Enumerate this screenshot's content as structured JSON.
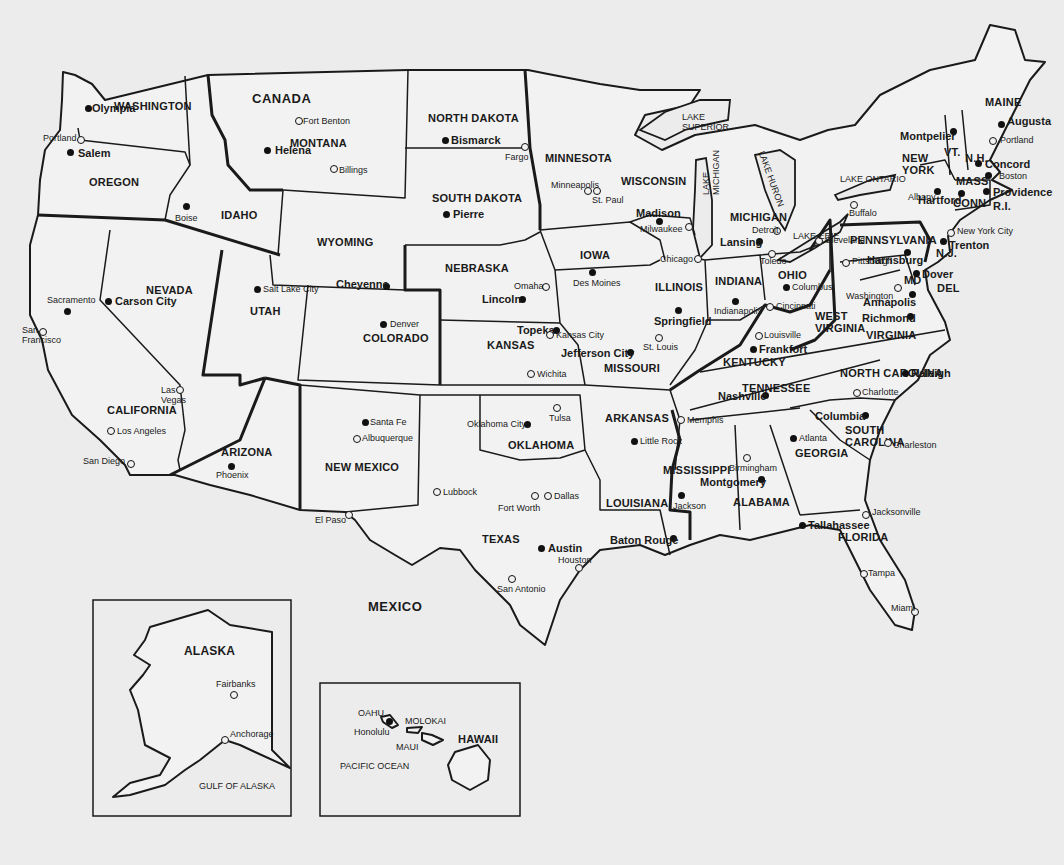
{
  "map": {
    "title": "United States Political Map",
    "countries": [
      {
        "name": "CANADA",
        "x": 252,
        "y": 92
      },
      {
        "name": "MEXICO",
        "x": 368,
        "y": 600
      }
    ],
    "states": [
      {
        "name": "WASHINGTON",
        "x": 114,
        "y": 101
      },
      {
        "name": "OREGON",
        "x": 89,
        "y": 177
      },
      {
        "name": "IDAHO",
        "x": 221,
        "y": 210
      },
      {
        "name": "MONTANA",
        "x": 290,
        "y": 138
      },
      {
        "name": "WYOMING",
        "x": 317,
        "y": 237
      },
      {
        "name": "NEVADA",
        "x": 146,
        "y": 285
      },
      {
        "name": "UTAH",
        "x": 250,
        "y": 306
      },
      {
        "name": "COLORADO",
        "x": 363,
        "y": 333
      },
      {
        "name": "CALIFORNIA",
        "x": 107,
        "y": 405
      },
      {
        "name": "ARIZONA",
        "x": 221,
        "y": 447
      },
      {
        "name": "NEW MEXICO",
        "x": 325,
        "y": 462
      },
      {
        "name": "NORTH DAKOTA",
        "x": 428,
        "y": 113
      },
      {
        "name": "SOUTH DAKOTA",
        "x": 432,
        "y": 193
      },
      {
        "name": "NEBRASKA",
        "x": 445,
        "y": 263
      },
      {
        "name": "KANSAS",
        "x": 487,
        "y": 340
      },
      {
        "name": "OKLAHOMA",
        "x": 508,
        "y": 440
      },
      {
        "name": "TEXAS",
        "x": 482,
        "y": 534
      },
      {
        "name": "MINNESOTA",
        "x": 545,
        "y": 153
      },
      {
        "name": "IOWA",
        "x": 580,
        "y": 250
      },
      {
        "name": "MISSOURI",
        "x": 604,
        "y": 363
      },
      {
        "name": "ARKANSAS",
        "x": 605,
        "y": 413
      },
      {
        "name": "LOUISIANA",
        "x": 606,
        "y": 498
      },
      {
        "name": "WISCONSIN",
        "x": 621,
        "y": 176
      },
      {
        "name": "ILLINOIS",
        "x": 655,
        "y": 282
      },
      {
        "name": "MICHIGAN",
        "x": 730,
        "y": 212
      },
      {
        "name": "INDIANA",
        "x": 715,
        "y": 276
      },
      {
        "name": "OHIO",
        "x": 778,
        "y": 270
      },
      {
        "name": "KENTUCKY",
        "x": 723,
        "y": 357
      },
      {
        "name": "TENNESSEE",
        "x": 742,
        "y": 383
      },
      {
        "name": "MISSISSIPPI",
        "x": 663,
        "y": 465
      },
      {
        "name": "ALABAMA",
        "x": 733,
        "y": 497
      },
      {
        "name": "GEORGIA",
        "x": 795,
        "y": 448
      },
      {
        "name": "FLORIDA",
        "x": 838,
        "y": 532
      },
      {
        "name": "SOUTH CAROLINA",
        "x": 845,
        "y": 424,
        "multiline": [
          "SOUTH",
          "CAROLINA"
        ]
      },
      {
        "name": "NORTH CAROLINA",
        "x": 840,
        "y": 368
      },
      {
        "name": "VIRGINIA",
        "x": 866,
        "y": 330
      },
      {
        "name": "WEST VIRGINIA",
        "x": 815,
        "y": 310,
        "multiline": [
          "WEST",
          "VIRGINIA"
        ]
      },
      {
        "name": "PENNSYLVANIA",
        "x": 850,
        "y": 235
      },
      {
        "name": "NEW YORK",
        "x": 902,
        "y": 152,
        "multiline": [
          "NEW",
          "YORK"
        ]
      },
      {
        "name": "VT.",
        "x": 944,
        "y": 147
      },
      {
        "name": "N.H.",
        "x": 965,
        "y": 153
      },
      {
        "name": "MAINE",
        "x": 985,
        "y": 97
      },
      {
        "name": "MASS",
        "x": 956,
        "y": 176
      },
      {
        "name": "CONN",
        "x": 953,
        "y": 198
      },
      {
        "name": "R.I.",
        "x": 993,
        "y": 201
      },
      {
        "name": "N.J.",
        "x": 936,
        "y": 248
      },
      {
        "name": "MD",
        "x": 904,
        "y": 275
      },
      {
        "name": "DEL",
        "x": 937,
        "y": 283
      }
    ],
    "capitals": [
      {
        "name": "Olympia",
        "x": 88,
        "y": 108,
        "lx": 92,
        "ly": 103
      },
      {
        "name": "Salem",
        "x": 70,
        "y": 152,
        "lx": 78,
        "ly": 148
      },
      {
        "name": "Boise",
        "x": 186,
        "y": 206,
        "lx": 175,
        "ly": 214,
        "small": true
      },
      {
        "name": "Helena",
        "x": 267,
        "y": 150,
        "lx": 275,
        "ly": 145
      },
      {
        "name": "Bismarck",
        "x": 445,
        "y": 140,
        "lx": 451,
        "ly": 135
      },
      {
        "name": "Pierre",
        "x": 446,
        "y": 214,
        "lx": 453,
        "ly": 209
      },
      {
        "name": "Cheyenne",
        "x": 386,
        "y": 286,
        "lx": 336,
        "ly": 279
      },
      {
        "name": "Carson City",
        "x": 108,
        "y": 301,
        "lx": 115,
        "ly": 296
      },
      {
        "name": "Salt Lake City",
        "x": 257,
        "y": 289,
        "lx": 263,
        "ly": 285,
        "small": true
      },
      {
        "name": "Denver",
        "x": 383,
        "y": 324,
        "lx": 390,
        "ly": 320,
        "small": true
      },
      {
        "name": "Sacramento",
        "x": 67,
        "y": 311,
        "lx": 47,
        "ly": 296,
        "small": true
      },
      {
        "name": "Phoenix",
        "x": 231,
        "y": 466,
        "lx": 216,
        "ly": 471,
        "small": true
      },
      {
        "name": "Santa Fe",
        "x": 365,
        "y": 422,
        "lx": 370,
        "ly": 418,
        "small": true
      },
      {
        "name": "Lincoln",
        "x": 522,
        "y": 299,
        "lx": 482,
        "ly": 294
      },
      {
        "name": "Topeka",
        "x": 556,
        "y": 330,
        "lx": 517,
        "ly": 325
      },
      {
        "name": "Oklahoma City",
        "x": 527,
        "y": 424,
        "lx": 467,
        "ly": 420,
        "small": true
      },
      {
        "name": "Austin",
        "x": 541,
        "y": 548,
        "lx": 548,
        "ly": 543
      },
      {
        "name": "Des Moines",
        "x": 592,
        "y": 272,
        "lx": 573,
        "ly": 279,
        "small": true
      },
      {
        "name": "Jefferson City",
        "x": 630,
        "y": 352,
        "lx": 561,
        "ly": 348
      },
      {
        "name": "Little Rock",
        "x": 634,
        "y": 441,
        "lx": 640,
        "ly": 437,
        "small": true
      },
      {
        "name": "Baton Rouge",
        "x": 673,
        "y": 538,
        "lx": 610,
        "ly": 535
      },
      {
        "name": "Jackson",
        "x": 681,
        "y": 495,
        "lx": 673,
        "ly": 502,
        "small": true
      },
      {
        "name": "Madison",
        "x": 659,
        "y": 221,
        "lx": 636,
        "ly": 208
      },
      {
        "name": "Springfield",
        "x": 678,
        "y": 310,
        "lx": 654,
        "ly": 316
      },
      {
        "name": "Lansing",
        "x": 759,
        "y": 241,
        "lx": 720,
        "ly": 237
      },
      {
        "name": "Indianapolis",
        "x": 735,
        "y": 301,
        "lx": 714,
        "ly": 307,
        "small": true
      },
      {
        "name": "Columbus",
        "x": 786,
        "y": 287,
        "lx": 792,
        "ly": 283,
        "small": true
      },
      {
        "name": "Frankfort",
        "x": 753,
        "y": 349,
        "lx": 759,
        "ly": 344
      },
      {
        "name": "Nashville",
        "x": 765,
        "y": 395,
        "lx": 718,
        "ly": 391
      },
      {
        "name": "Montgomery",
        "x": 761,
        "y": 479,
        "lx": 700,
        "ly": 477
      },
      {
        "name": "Atlanta",
        "x": 793,
        "y": 438,
        "lx": 799,
        "ly": 434,
        "small": true
      },
      {
        "name": "Tallahassee",
        "x": 802,
        "y": 525,
        "lx": 808,
        "ly": 520
      },
      {
        "name": "Columbia",
        "x": 865,
        "y": 415,
        "lx": 815,
        "ly": 411
      },
      {
        "name": "Raleigh",
        "x": 905,
        "y": 373,
        "lx": 911,
        "ly": 368
      },
      {
        "name": "Richmond",
        "x": 910,
        "y": 316,
        "lx": 862,
        "ly": 313
      },
      {
        "name": "Annapolis",
        "x": 912,
        "y": 294,
        "lx": 863,
        "ly": 297
      },
      {
        "name": "Dover",
        "x": 916,
        "y": 273,
        "lx": 922,
        "ly": 269
      },
      {
        "name": "Trenton",
        "x": 943,
        "y": 241,
        "lx": 949,
        "ly": 240
      },
      {
        "name": "Harrisburg",
        "x": 907,
        "y": 252,
        "lx": 867,
        "ly": 255
      },
      {
        "name": "Hartford",
        "x": 961,
        "y": 193,
        "lx": 918,
        "ly": 195
      },
      {
        "name": "Providence",
        "x": 986,
        "y": 191,
        "lx": 993,
        "ly": 187
      },
      {
        "name": "Albany",
        "x": 937,
        "y": 191,
        "lx": 908,
        "ly": 193,
        "small": true
      },
      {
        "name": "Montpelier",
        "x": 953,
        "y": 131,
        "lx": 900,
        "ly": 131
      },
      {
        "name": "Concord",
        "x": 978,
        "y": 163,
        "lx": 985,
        "ly": 159
      },
      {
        "name": "Boston",
        "x": 988,
        "y": 175,
        "lx": 999,
        "ly": 172,
        "small": true
      },
      {
        "name": "Augusta",
        "x": 1001,
        "y": 124,
        "lx": 1007,
        "ly": 116
      }
    ],
    "cities": [
      {
        "name": "Portland",
        "x": 80,
        "y": 139,
        "lx": 43,
        "ly": 134
      },
      {
        "name": "Fort Benton",
        "x": 298,
        "y": 120,
        "lx": 303,
        "ly": 117
      },
      {
        "name": "Billings",
        "x": 333,
        "y": 168,
        "lx": 339,
        "ly": 166
      },
      {
        "name": "Fargo",
        "x": 524,
        "y": 146,
        "lx": 505,
        "ly": 153
      },
      {
        "name": "Minneapolis",
        "x": 587,
        "y": 190,
        "lx": 551,
        "ly": 181
      },
      {
        "name": "St. Paul",
        "x": 596,
        "y": 190,
        "lx": 592,
        "ly": 196
      },
      {
        "name": "Milwaukee",
        "x": 688,
        "y": 226,
        "lx": 640,
        "ly": 225
      },
      {
        "name": "Chicago",
        "x": 697,
        "y": 258,
        "lx": 660,
        "ly": 255
      },
      {
        "name": "Detroit",
        "x": 776,
        "y": 230,
        "lx": 752,
        "ly": 226
      },
      {
        "name": "Toledo",
        "x": 771,
        "y": 253,
        "lx": 760,
        "ly": 257
      },
      {
        "name": "Cleveland",
        "x": 818,
        "y": 240,
        "lx": 825,
        "ly": 236
      },
      {
        "name": "Buffalo",
        "x": 853,
        "y": 204,
        "lx": 849,
        "ly": 209
      },
      {
        "name": "Pittsburgh",
        "x": 845,
        "y": 262,
        "lx": 852,
        "ly": 257
      },
      {
        "name": "Washington",
        "x": 897,
        "y": 287,
        "lx": 846,
        "ly": 292
      },
      {
        "name": "New York City",
        "x": 950,
        "y": 232,
        "lx": 957,
        "ly": 227
      },
      {
        "name": "Portland",
        "x": 992,
        "y": 140,
        "lx": 1000,
        "ly": 136
      },
      {
        "name": "Cincinnati",
        "x": 769,
        "y": 306,
        "lx": 776,
        "ly": 302
      },
      {
        "name": "Louisville",
        "x": 758,
        "y": 335,
        "lx": 764,
        "ly": 331
      },
      {
        "name": "Omaha",
        "x": 545,
        "y": 286,
        "lx": 514,
        "ly": 282
      },
      {
        "name": "Kansas City",
        "x": 549,
        "y": 334,
        "lx": 556,
        "ly": 331
      },
      {
        "name": "St. Louis",
        "x": 658,
        "y": 337,
        "lx": 643,
        "ly": 343
      },
      {
        "name": "Wichita",
        "x": 530,
        "y": 373,
        "lx": 537,
        "ly": 370
      },
      {
        "name": "Tulsa",
        "x": 556,
        "y": 407,
        "lx": 549,
        "ly": 414
      },
      {
        "name": "Memphis",
        "x": 680,
        "y": 419,
        "lx": 687,
        "ly": 416
      },
      {
        "name": "Charlotte",
        "x": 856,
        "y": 392,
        "lx": 862,
        "ly": 388
      },
      {
        "name": "Birmingham",
        "x": 746,
        "y": 457,
        "lx": 729,
        "ly": 464
      },
      {
        "name": "Charleston",
        "x": 887,
        "y": 442,
        "lx": 893,
        "ly": 441
      },
      {
        "name": "Jacksonville",
        "x": 865,
        "y": 514,
        "lx": 872,
        "ly": 508
      },
      {
        "name": "Tampa",
        "x": 863,
        "y": 573,
        "lx": 868,
        "ly": 569
      },
      {
        "name": "Miami",
        "x": 914,
        "y": 611,
        "lx": 891,
        "ly": 604
      },
      {
        "name": "Lubbock",
        "x": 436,
        "y": 491,
        "lx": 443,
        "ly": 488
      },
      {
        "name": "Fort Worth",
        "x": 534,
        "y": 495,
        "lx": 498,
        "ly": 504
      },
      {
        "name": "Dallas",
        "x": 547,
        "y": 495,
        "lx": 554,
        "ly": 492
      },
      {
        "name": "Houston",
        "x": 578,
        "y": 567,
        "lx": 558,
        "ly": 556
      },
      {
        "name": "San Antonio",
        "x": 511,
        "y": 578,
        "lx": 497,
        "ly": 585
      },
      {
        "name": "El Paso",
        "x": 348,
        "y": 514,
        "lx": 315,
        "ly": 516
      },
      {
        "name": "Albuquerque",
        "x": 356,
        "y": 438,
        "lx": 362,
        "ly": 434
      },
      {
        "name": "Las Vegas",
        "x": 179,
        "y": 389,
        "lx": 161,
        "ly": 386,
        "multiline": [
          "Las",
          "Vegas"
        ]
      },
      {
        "name": "Los Angeles",
        "x": 110,
        "y": 430,
        "lx": 117,
        "ly": 427
      },
      {
        "name": "San Diego",
        "x": 130,
        "y": 463,
        "lx": 83,
        "ly": 457
      },
      {
        "name": "San Francisco",
        "x": 42,
        "y": 331,
        "lx": 22,
        "ly": 326,
        "multiline": [
          "San",
          "Francisco"
        ]
      }
    ],
    "lakes": [
      {
        "name": "LAKE SUPERIOR",
        "x": 682,
        "y": 113,
        "multiline": [
          "LAKE",
          "SUPERIOR"
        ]
      },
      {
        "name": "LAKE MICHIGAN",
        "x": 702,
        "y": 195,
        "multiline": [
          "LAKE",
          "MICHIGAN"
        ],
        "vertical": true
      },
      {
        "name": "LAKE HURON",
        "x": 765,
        "y": 150,
        "multiline": [
          "LAKE HURON"
        ],
        "vertical": true
      },
      {
        "name": "LAKE ERIE",
        "x": 793,
        "y": 232
      },
      {
        "name": "LAKE ONTARIO",
        "x": 840,
        "y": 175
      }
    ],
    "alaska_inset": {
      "title": "ALASKA",
      "cities": [
        {
          "name": "Fairbanks",
          "x": 233,
          "y": 694
        },
        {
          "name": "Anchorage",
          "x": 224,
          "y": 739
        }
      ],
      "water": "GULF OF ALASKA"
    },
    "hawaii_inset": {
      "islands": [
        "OAHU",
        "MOLOKAI",
        "MAUI",
        "HAWAII"
      ],
      "capital": "Honolulu",
      "water": "PACIFIC OCEAN"
    }
  }
}
